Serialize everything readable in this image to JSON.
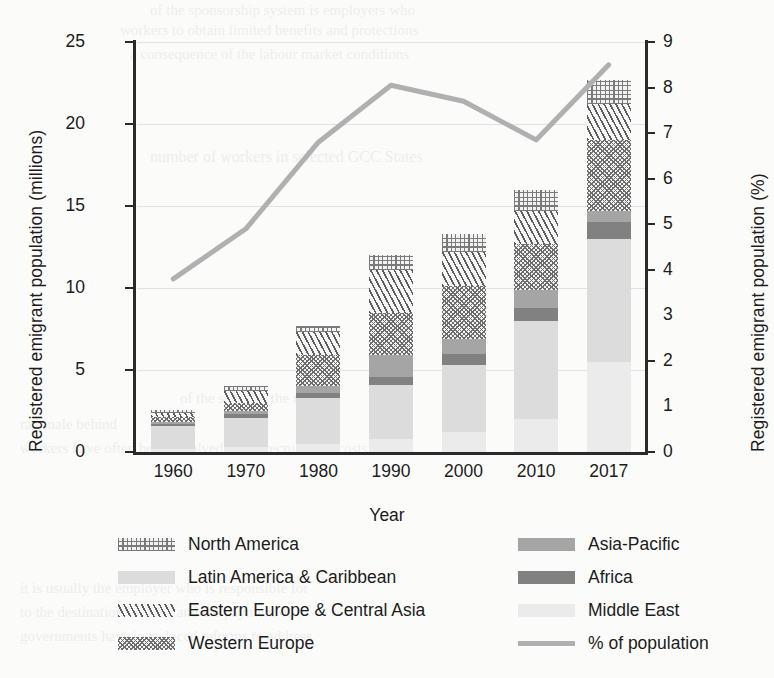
{
  "chart_data": {
    "type": "bar",
    "title": "",
    "subtitle": "",
    "xlabel": "Year",
    "ylabel": "Registered emigrant population (millions)",
    "ylabel_secondary": "Registered emigrant population (%)",
    "categories": [
      "1960",
      "1970",
      "1980",
      "1990",
      "2000",
      "2010",
      "2017"
    ],
    "ylim": [
      0,
      25
    ],
    "yticks": [
      0,
      5,
      10,
      15,
      20,
      25
    ],
    "ylim_secondary": [
      0,
      9
    ],
    "yticks_secondary": [
      0,
      1,
      2,
      3,
      4,
      5,
      6,
      7,
      8,
      9
    ],
    "grid": true,
    "legend_position": "bottom",
    "stacking": "bottom-to-top",
    "series": [
      {
        "name": "Middle East",
        "pattern": "solid-very-light-gray",
        "color": "#ebebeb",
        "values": [
          0.2,
          0.3,
          0.5,
          0.8,
          1.2,
          2.0,
          5.5
        ]
      },
      {
        "name": "Latin America & Caribbean",
        "pattern": "solid-light-gray",
        "color": "#dcdcdc",
        "values": [
          1.4,
          1.8,
          2.8,
          3.3,
          4.1,
          6.0,
          7.5
        ]
      },
      {
        "name": "Africa",
        "pattern": "solid-dark-gray",
        "color": "#818181",
        "values": [
          0.1,
          0.2,
          0.3,
          0.5,
          0.7,
          0.8,
          1.0
        ]
      },
      {
        "name": "Asia-Pacific",
        "pattern": "solid-medium-gray",
        "color": "#a5a5a5",
        "values": [
          0.15,
          0.2,
          0.4,
          1.3,
          0.9,
          1.1,
          0.7
        ]
      },
      {
        "name": "Western Europe",
        "pattern": "fine-checkered",
        "color": "#6d6d6d",
        "values": [
          0.3,
          0.5,
          1.9,
          2.6,
          3.2,
          2.8,
          4.3
        ]
      },
      {
        "name": "Eastern Europe & Central Asia",
        "pattern": "diagonal-hatch",
        "color": "#5d5d5d",
        "values": [
          0.25,
          0.7,
          1.4,
          2.6,
          2.1,
          2.0,
          2.2
        ]
      },
      {
        "name": "North America",
        "pattern": "dotted-mesh",
        "color": "#7a7a7a",
        "values": [
          0.15,
          0.3,
          0.4,
          0.9,
          1.1,
          1.3,
          1.5
        ]
      }
    ],
    "line_series": {
      "name": "% of population",
      "color": "#b0b0b0",
      "axis": "secondary",
      "units": "%",
      "values": [
        3.8,
        4.9,
        6.8,
        8.05,
        7.7,
        6.85,
        8.5
      ]
    },
    "bar_totals": [
      2.55,
      4.0,
      7.7,
      12.0,
      13.3,
      16.0,
      22.7
    ]
  },
  "axes": {
    "left_title": "Registered emigrant population (millions)",
    "right_title": "Registered emigrant population (%)",
    "x_title": "Year",
    "left_ticks": [
      "25",
      "20",
      "15",
      "10",
      "5",
      "0"
    ],
    "right_ticks": [
      "9",
      "8",
      "7",
      "6",
      "5",
      "4",
      "3",
      "2",
      "1",
      "0"
    ],
    "x_ticks": [
      "1960",
      "1970",
      "1980",
      "1990",
      "2000",
      "2010",
      "2017"
    ]
  },
  "legend": {
    "column_left": [
      {
        "label": "North America",
        "swatch": "dotted-mesh-swatch"
      },
      {
        "label": "Latin America & Caribbean",
        "swatch": "light-gray-swatch"
      },
      {
        "label": "Eastern Europe & Central Asia",
        "swatch": "diagonal-hatch-swatch"
      },
      {
        "label": "Western Europe",
        "swatch": "fine-checkered-swatch"
      }
    ],
    "column_right": [
      {
        "label": "Asia-Pacific",
        "swatch": "medium-gray-swatch"
      },
      {
        "label": "Africa",
        "swatch": "dark-gray-swatch"
      },
      {
        "label": "Middle East",
        "swatch": "very-light-gray-swatch"
      },
      {
        "label": "% of population",
        "swatch": "line-swatch"
      }
    ]
  },
  "colors": {
    "north_america": "#7a7a7a",
    "latin_america": "#dcdcdc",
    "eastern_europe": "#5d5d5d",
    "western_europe": "#6d6d6d",
    "asia_pacific": "#a5a5a5",
    "africa": "#818181",
    "middle_east": "#ebebeb",
    "line": "#b0b0b0",
    "axis": "#2a2a2a",
    "grid": "#e2e2e2",
    "background": "#fbfbfa"
  }
}
